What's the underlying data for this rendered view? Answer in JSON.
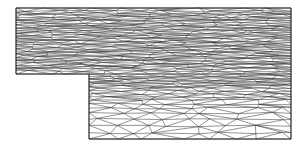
{
  "figure": {
    "type": "finite-element-triangular-mesh",
    "colors": {
      "background": "#ffffff",
      "edges": "#3a3a3a",
      "boundary": "#2a2a2a"
    }
  },
  "domain": {
    "outline": [
      [
        16,
        8
      ],
      [
        291,
        8
      ],
      [
        291,
        139
      ],
      [
        89,
        139
      ],
      [
        89,
        74
      ],
      [
        16,
        74
      ]
    ],
    "upper_channel": {
      "x0": 16,
      "x1": 291,
      "y0": 8,
      "y1": 74
    },
    "lower_channel": {
      "x0": 89,
      "x1": 291,
      "y0": 74,
      "y1": 139
    },
    "step_corner": [
      89,
      74
    ]
  },
  "mesh": {
    "upper_rows_y": [
      8,
      11,
      13,
      15,
      17,
      19,
      21,
      23,
      25,
      27,
      29,
      31,
      33,
      35,
      37,
      39,
      41,
      43,
      45,
      47,
      49,
      51,
      53,
      55,
      57,
      59,
      61,
      63,
      65,
      67,
      69,
      71,
      74
    ],
    "lower_rows_y": [
      74,
      76,
      78,
      80,
      82,
      84,
      86,
      88,
      91,
      94,
      97,
      100,
      104,
      108,
      113,
      119,
      126,
      133,
      139
    ],
    "upper_cols": 11,
    "lower_cols": 8,
    "seed": 7
  }
}
